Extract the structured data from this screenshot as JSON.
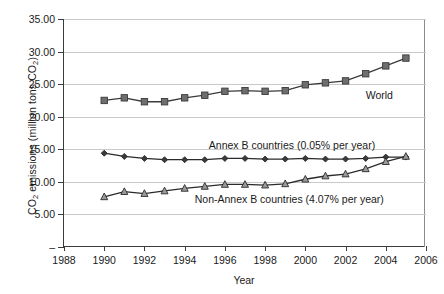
{
  "chart_data": {
    "type": "line",
    "title": "",
    "xlabel": "Year",
    "ylabel": "CO2 emissions (million tons CO2)",
    "ylabel_main": "CO",
    "ylabel_sub1": "2",
    "ylabel_mid": " emissions (million tons CO",
    "ylabel_sub2": "2",
    "ylabel_end": ")",
    "xlim": [
      1988,
      2006
    ],
    "ylim": [
      0,
      35
    ],
    "grid": true,
    "legend_position": "inline-annotations",
    "xticks": [
      1988,
      1990,
      1992,
      1994,
      1996,
      1998,
      2000,
      2002,
      2004,
      2006
    ],
    "xtick_labels": [
      "1988",
      "1990",
      "1992",
      "1994",
      "1996",
      "1998",
      "2000",
      "2002",
      "2004",
      "2006"
    ],
    "yticks": [
      0,
      5,
      10,
      15,
      20,
      25,
      30,
      35
    ],
    "ytick_labels": [
      "–",
      "5.00",
      "10.00",
      "15.00",
      "20.00",
      "25.00",
      "30.00",
      "35.00"
    ],
    "x": [
      1990,
      1991,
      1992,
      1993,
      1994,
      1995,
      1996,
      1997,
      1998,
      1999,
      2000,
      2001,
      2002,
      2003,
      2004,
      2005
    ],
    "series": [
      {
        "name": "World",
        "marker": "square",
        "marker_fill": "#6e6e6e",
        "marker_stroke": "#3a3a3a",
        "line_color": "#3a3a3a",
        "annotation": "World",
        "values": [
          22.5,
          22.9,
          22.3,
          22.3,
          22.9,
          23.3,
          23.9,
          24.0,
          23.9,
          24.0,
          24.9,
          25.2,
          25.5,
          26.6,
          27.8,
          29.0
        ]
      },
      {
        "name": "Annex B countries (0.05% per year)",
        "marker": "diamond",
        "marker_fill": "#3a3a3a",
        "marker_stroke": "#2a2a2a",
        "line_color": "#2a2a2a",
        "annotation": "Annex B countries (0.05% per year)",
        "values": [
          14.4,
          13.9,
          13.6,
          13.4,
          13.4,
          13.4,
          13.6,
          13.6,
          13.5,
          13.5,
          13.6,
          13.5,
          13.5,
          13.6,
          13.8,
          13.8
        ]
      },
      {
        "name": "Non-Annex B countries (4.07% per year)",
        "marker": "triangle",
        "marker_fill": "#9a9a9a",
        "marker_stroke": "#2a2a2a",
        "line_color": "#2a2a2a",
        "annotation": "Non-Annex B countries (4.07% per year)",
        "values": [
          7.7,
          8.5,
          8.2,
          8.6,
          9.0,
          9.3,
          9.6,
          9.6,
          9.5,
          9.7,
          10.4,
          10.9,
          11.2,
          12.0,
          13.1,
          13.9
        ]
      }
    ],
    "annotations": [
      {
        "text": "World",
        "x": 2003.0,
        "y": 24.2
      },
      {
        "text": "Annex B countries (0.05% per year)",
        "x": 1995.2,
        "y": 16.6
      },
      {
        "text": "Non-Annex B countries (4.07% per year)",
        "x": 1994.5,
        "y": 8.3
      }
    ]
  }
}
